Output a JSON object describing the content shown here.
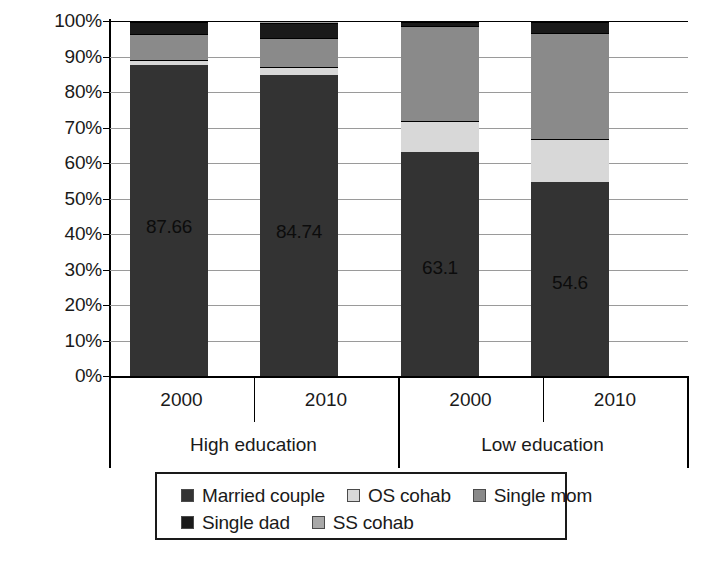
{
  "chart_data": {
    "type": "bar",
    "subtype": "stacked-100-percent",
    "title": "",
    "xlabel": "",
    "ylabel": "",
    "ylim": [
      0,
      100
    ],
    "ytick_labels": [
      "100%",
      "90%",
      "80%",
      "70%",
      "60%",
      "50%",
      "40%",
      "30%",
      "20%",
      "10%",
      "0%"
    ],
    "ytick_values": [
      100,
      90,
      80,
      70,
      60,
      50,
      40,
      30,
      20,
      10,
      0
    ],
    "grid": true,
    "legend_position": "bottom",
    "categories": [
      "2000",
      "2010",
      "2000",
      "2010"
    ],
    "groups": [
      {
        "label": "High education",
        "categories": [
          "2000",
          "2010"
        ]
      },
      {
        "label": "Low education",
        "categories": [
          "2000",
          "2010"
        ]
      }
    ],
    "series": [
      {
        "name": "Married couple",
        "color": "#333333",
        "values": [
          87.66,
          84.74,
          63.1,
          54.6
        ]
      },
      {
        "name": "OS cohab",
        "color": "#d8d8d8",
        "values": [
          1.5,
          2.3,
          8.6,
          12.3
        ]
      },
      {
        "name": "Single mom",
        "color": "#8a8a8a",
        "values": [
          7.3,
          8.3,
          26.8,
          29.6
        ]
      },
      {
        "name": "Single dad",
        "color": "#1a1a1a",
        "values": [
          3.2,
          4.2,
          1.2,
          3.3
        ]
      },
      {
        "name": "SS cohab",
        "color": "#a8a8a8",
        "values": [
          0.34,
          0.46,
          0.3,
          0.2
        ]
      }
    ],
    "bar_value_labels": [
      "87.66",
      "84.74",
      "63.1",
      "54.6"
    ],
    "bar_value_label_series": "Married couple"
  },
  "legend": {
    "rows": [
      [
        {
          "label": "Married couple",
          "color": "#333333"
        },
        {
          "label": "OS cohab",
          "color": "#d8d8d8"
        },
        {
          "label": "Single mom",
          "color": "#8a8a8a"
        }
      ],
      [
        {
          "label": "Single dad",
          "color": "#1a1a1a"
        },
        {
          "label": "SS cohab",
          "color": "#a8a8a8"
        }
      ]
    ]
  }
}
